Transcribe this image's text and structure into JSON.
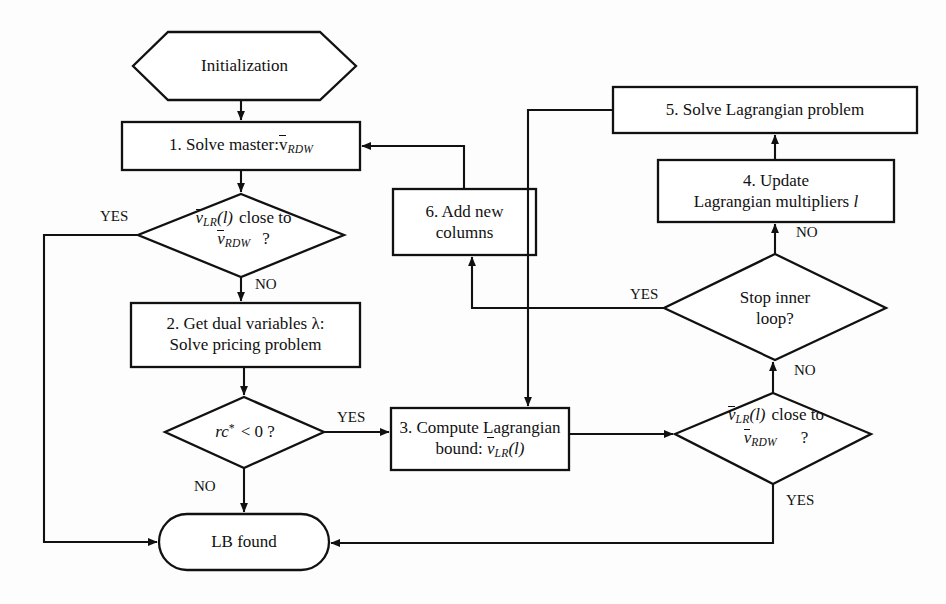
{
  "diagram": {
    "type": "flowchart",
    "background_color": "#ffffff",
    "line_color": "#111111",
    "text_color": "#111111"
  },
  "nodes": [
    {
      "id": "init",
      "shape": "hexagon",
      "name": "initialization-node",
      "text": "Initialization"
    },
    {
      "id": "step1",
      "shape": "rectangle",
      "name": "step-1-solve-master",
      "text_plain": "1. Solve master: v̄_RDW",
      "prefix": "1. Solve master:",
      "var_base": "v",
      "var_sub": "RDW"
    },
    {
      "id": "dec1",
      "shape": "diamond",
      "name": "decision-lr-close-to-rdw-left",
      "line1_base": "v",
      "line1_sub": "LR",
      "line1_arg": "(l)",
      "line1_tail": "close to",
      "line2_base": "v",
      "line2_sub": "RDW",
      "line2_tail": "?",
      "text_plain": "v̄_LR(l) close to v̄_RDW ?"
    },
    {
      "id": "step2",
      "shape": "rectangle",
      "name": "step-2-get-dual-variables",
      "line1": "2. Get dual variables λ:",
      "line2": "Solve pricing problem",
      "text_plain": "2. Get dual variables λ: Solve pricing problem"
    },
    {
      "id": "dec2",
      "shape": "diamond",
      "name": "decision-reduced-cost-negative",
      "var_base": "rc",
      "var_sup": "*",
      "tail": "< 0 ?",
      "text_plain": "rc* < 0 ?"
    },
    {
      "id": "step3",
      "shape": "rectangle",
      "name": "step-3-compute-lagrangian-bound",
      "line1": "3. Compute Lagrangian",
      "line2_prefix": "bound:",
      "line2_base": "v",
      "line2_sub": "LR",
      "line2_arg": "(l)",
      "text_plain": "3. Compute Lagrangian bound: v̄_LR(l)"
    },
    {
      "id": "dec3",
      "shape": "diamond",
      "name": "decision-lr-close-to-rdw-right",
      "line1_base": "v",
      "line1_sub": "LR",
      "line1_arg": "(l)",
      "line1_tail": "close to",
      "line2_base": "v",
      "line2_sub": "RDW",
      "line2_tail": "?",
      "text_plain": "v̄_LR(l) close to v̄_RDW ?"
    },
    {
      "id": "dec4",
      "shape": "diamond",
      "name": "decision-stop-inner-loop",
      "line1": "Stop inner",
      "line2": "loop?",
      "text_plain": "Stop inner loop?"
    },
    {
      "id": "step4",
      "shape": "rectangle",
      "name": "step-4-update-lagrangian-multipliers",
      "line1": "4. Update",
      "line2_prefix": "Lagrangian multipliers",
      "line2_var": "l",
      "text_plain": "4. Update Lagrangian multipliers l"
    },
    {
      "id": "step5",
      "shape": "rectangle",
      "name": "step-5-solve-lagrangian-problem",
      "text": "5. Solve Lagrangian problem"
    },
    {
      "id": "step6",
      "shape": "rectangle",
      "name": "step-6-add-new-columns",
      "line1": "6. Add new",
      "line2": "columns",
      "text_plain": "6. Add new columns"
    },
    {
      "id": "lb",
      "shape": "stadium",
      "name": "terminal-lb-found",
      "text": "LB found"
    }
  ],
  "edge_labels": {
    "dec1_yes": "YES",
    "dec1_no": "NO",
    "dec2_yes": "YES",
    "dec2_no": "NO",
    "dec3_yes": "YES",
    "dec3_no": "NO",
    "dec4_yes": "YES",
    "dec4_no": "NO"
  }
}
